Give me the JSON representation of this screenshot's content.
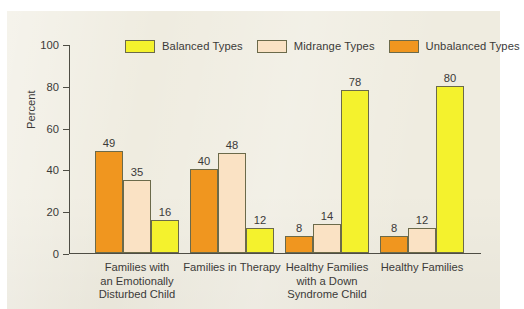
{
  "chart_data": {
    "type": "bar",
    "title": "",
    "subtitle": "",
    "xlabel": "",
    "ylabel": "Percent",
    "ylim": [
      0,
      100
    ],
    "yticks": [
      0,
      20,
      40,
      60,
      80,
      100
    ],
    "ytick_labels": [
      "0",
      "20",
      "40",
      "60",
      "80",
      "100"
    ],
    "grid": false,
    "legend_position": "top",
    "categories": [
      "Families with an Emotionally Disturbed Child",
      "Families in Therapy",
      "Healthy Families with a Down Syndrome Child",
      "Healthy Families"
    ],
    "category_lines": [
      [
        "Families with",
        "an Emotionally",
        "Disturbed Child"
      ],
      [
        "Families in Therapy"
      ],
      [
        "Healthy Families",
        "with a Down",
        "Syndrome Child"
      ],
      [
        "Healthy Families"
      ]
    ],
    "series": [
      {
        "name": "Unbalanced Types",
        "color": "#f0961f",
        "values": [
          49,
          40,
          8,
          8
        ]
      },
      {
        "name": "Midrange Types",
        "color": "#fae2c4",
        "values": [
          35,
          48,
          14,
          12
        ]
      },
      {
        "name": "Balanced Types",
        "color": "#f4f22d",
        "values": [
          16,
          12,
          78,
          80
        ]
      }
    ],
    "draw_order": [
      "Unbalanced Types",
      "Midrange Types",
      "Balanced Types"
    ]
  },
  "legend": {
    "entries": [
      {
        "label": "Balanced Types",
        "color": "#f4f22d"
      },
      {
        "label": "Midrange Types",
        "color": "#fae2c4"
      },
      {
        "label": "Unbalanced Types",
        "color": "#f0961f"
      }
    ]
  },
  "axis": {
    "y_label": "Percent",
    "y_ticks": [
      "100",
      "80",
      "60",
      "40",
      "20",
      "0"
    ]
  },
  "colors": {
    "balanced": "#f4f22d",
    "midrange": "#fae2c4",
    "unbalanced": "#f0961f",
    "panel_background": "#efece0",
    "axis": "#4e4d44",
    "text": "#3b3a38",
    "bar_outline": "#6b6a4a"
  }
}
